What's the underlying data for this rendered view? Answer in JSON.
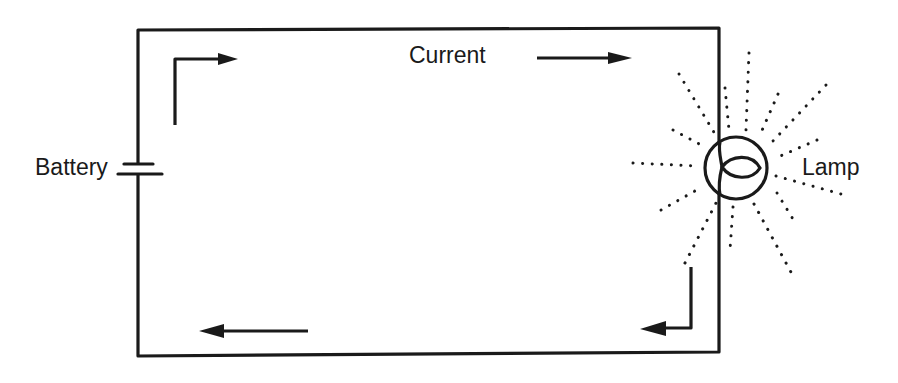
{
  "diagram": {
    "labels": {
      "current": "Current",
      "battery": "Battery",
      "lamp": "Lamp"
    },
    "components": [
      {
        "id": "battery",
        "type": "battery-cell",
        "position": "left wire"
      },
      {
        "id": "lamp",
        "type": "incandescent-lamp",
        "position": "right wire",
        "state": "lit (radiating dotted rays)"
      }
    ],
    "current_direction": "clockwise",
    "arrows": [
      {
        "id": "top-left-arrow",
        "shape": "elbow up-then-right",
        "points_to": "right"
      },
      {
        "id": "top-current-arrow",
        "shape": "straight",
        "points_to": "right"
      },
      {
        "id": "bottom-right-arrow",
        "shape": "elbow down-then-left",
        "points_to": "left"
      },
      {
        "id": "bottom-left-arrow",
        "shape": "straight",
        "points_to": "left"
      }
    ],
    "colors": {
      "line": "#1a1a1a",
      "background": "#ffffff"
    }
  }
}
